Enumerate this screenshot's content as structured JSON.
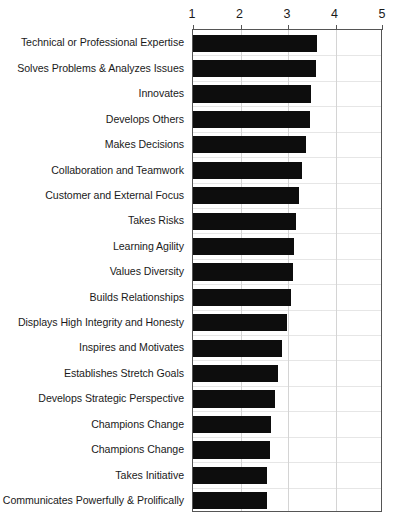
{
  "chart_data": {
    "type": "bar",
    "orientation": "horizontal",
    "title": "",
    "subtitle": "",
    "xlabel": "",
    "ylabel": "",
    "xlim": [
      1,
      5
    ],
    "ylim": null,
    "grid": true,
    "legend": null,
    "xticks": [
      1,
      2,
      3,
      4,
      5
    ],
    "xtick_labels": [
      "1",
      "2",
      "3",
      "4",
      "5"
    ],
    "categories": [
      "Technical or Professional Expertise",
      "Solves Problems & Analyzes Issues",
      "Innovates",
      "Develops Others",
      "Makes Decisions",
      "Collaboration and Teamwork",
      "Customer and External Focus",
      "Takes Risks",
      "Learning Agility",
      "Values Diversity",
      "Builds Relationships",
      "Displays High Integrity and Honesty",
      "Inspires and Motivates",
      "Establishes Stretch Goals",
      "Develops Strategic Perspective",
      "Champions Change",
      "Champions Change",
      "Takes Initiative",
      "Communicates Powerfully & Prolifically"
    ],
    "values": [
      3.61,
      3.59,
      3.48,
      3.46,
      3.37,
      3.29,
      3.24,
      3.17,
      3.13,
      3.1,
      3.06,
      2.98,
      2.87,
      2.78,
      2.72,
      2.65,
      2.63,
      2.56,
      2.55
    ],
    "bar_color": "#0d0d0d",
    "background_color": "#ffffff",
    "axis_color": "#555555",
    "gridline_color": "#d4d4d4"
  },
  "axis": {
    "tick_labels": [
      "1",
      "2",
      "3",
      "4",
      "5"
    ]
  }
}
